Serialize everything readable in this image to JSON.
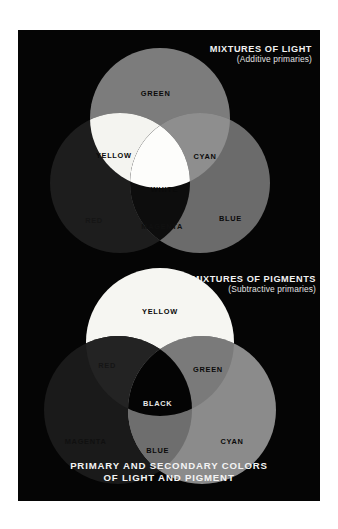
{
  "figure": {
    "title": "PRIMARY AND SECONDARY COLORS OF LIGHT AND PIGMENT",
    "background_color": "#ffffff",
    "plate_color": "#050505",
    "rendering": "grayscale halftone print scan"
  },
  "caption": {
    "line1": "PRIMARY AND SECONDARY COLORS",
    "line2": "OF LIGHT AND PIGMENT"
  },
  "panels": [
    {
      "id": "light",
      "heading": "MIXTURES OF LIGHT",
      "subheading": "(Additive primaries)",
      "model": "additive",
      "primaries": [
        "RED",
        "GREEN",
        "BLUE"
      ],
      "secondaries": [
        "YELLOW",
        "CYAN",
        "MAGENTA"
      ],
      "center": "WHITE",
      "labels": {
        "green": "GREEN",
        "yellow": "YELLOW",
        "cyan": "CYAN",
        "white": "WHITE",
        "red": "RED",
        "magenta": "MAGENTA",
        "blue": "BLUE"
      },
      "tones": {
        "green": "#7c7c7c",
        "red": "#1d1d1d",
        "blue": "#6b6b6b",
        "yellow": "#f4f4f0",
        "cyan": "#8e8e8e",
        "magenta": "#0d0d0d",
        "white": "#fdfdfb"
      }
    },
    {
      "id": "pigment",
      "heading": "MIXTURES OF PIGMENTS",
      "subheading": "(Subtractive primaries)",
      "model": "subtractive",
      "primaries": [
        "YELLOW",
        "CYAN",
        "MAGENTA"
      ],
      "secondaries": [
        "RED",
        "GREEN",
        "BLUE"
      ],
      "center": "BLACK",
      "labels": {
        "yellow": "YELLOW",
        "red": "RED",
        "green": "GREEN",
        "black": "BLACK",
        "magenta": "MAGENTA",
        "blue": "BLUE",
        "cyan": "CYAN"
      },
      "tones": {
        "yellow": "#f6f6f2",
        "magenta": "#1a1a1a",
        "cyan": "#8b8b8b",
        "red": "#232323",
        "green": "#7a7a7a",
        "blue": "#6e6e6e",
        "black": "#040404"
      }
    }
  ]
}
